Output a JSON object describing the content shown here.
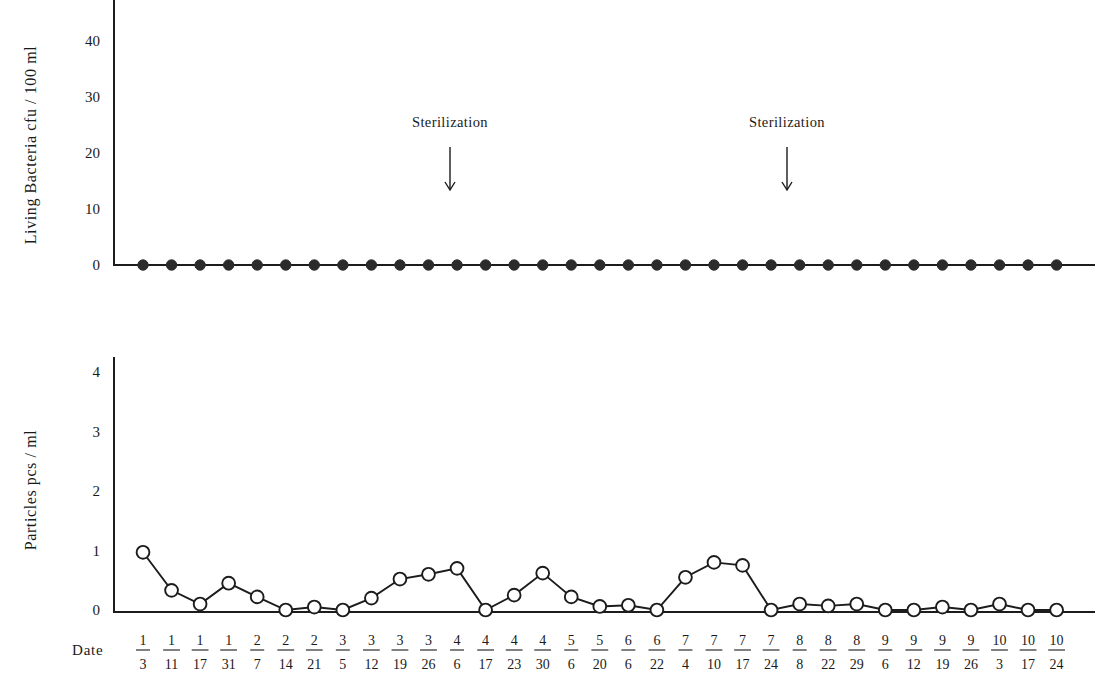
{
  "figure": {
    "width": 1110,
    "height": 681,
    "background": "#ffffff",
    "ink_color": "#1c1c1c"
  },
  "x_axis": {
    "label": "Date",
    "categories": [
      "1/3",
      "1/11",
      "1/17",
      "1/31",
      "2/7",
      "2/14",
      "2/21",
      "3/5",
      "3/12",
      "3/19",
      "3/26",
      "4/6",
      "4/17",
      "4/23",
      "4/30",
      "5/6",
      "5/20",
      "6/6",
      "6/22",
      "7/4",
      "7/10",
      "7/17",
      "7/24",
      "8/8",
      "8/22",
      "8/29",
      "9/6",
      "9/12",
      "9/19",
      "9/26",
      "10/3",
      "10/17",
      "10/24"
    ],
    "category_parts": [
      {
        "month": "1",
        "day": "3"
      },
      {
        "month": "1",
        "day": "11"
      },
      {
        "month": "1",
        "day": "17"
      },
      {
        "month": "1",
        "day": "31"
      },
      {
        "month": "2",
        "day": "7"
      },
      {
        "month": "2",
        "day": "14"
      },
      {
        "month": "2",
        "day": "21"
      },
      {
        "month": "3",
        "day": "5"
      },
      {
        "month": "3",
        "day": "12"
      },
      {
        "month": "3",
        "day": "19"
      },
      {
        "month": "3",
        "day": "26"
      },
      {
        "month": "4",
        "day": "6"
      },
      {
        "month": "4",
        "day": "17"
      },
      {
        "month": "4",
        "day": "23"
      },
      {
        "month": "4",
        "day": "30"
      },
      {
        "month": "5",
        "day": "6"
      },
      {
        "month": "5",
        "day": "20"
      },
      {
        "month": "6",
        "day": "6"
      },
      {
        "month": "6",
        "day": "22"
      },
      {
        "month": "7",
        "day": "4"
      },
      {
        "month": "7",
        "day": "10"
      },
      {
        "month": "7",
        "day": "17"
      },
      {
        "month": "7",
        "day": "24"
      },
      {
        "month": "8",
        "day": "8"
      },
      {
        "month": "8",
        "day": "22"
      },
      {
        "month": "8",
        "day": "29"
      },
      {
        "month": "9",
        "day": "6"
      },
      {
        "month": "9",
        "day": "12"
      },
      {
        "month": "9",
        "day": "19"
      },
      {
        "month": "9",
        "day": "26"
      },
      {
        "month": "10",
        "day": "3"
      },
      {
        "month": "10",
        "day": "17"
      },
      {
        "month": "10",
        "day": "24"
      }
    ]
  },
  "annotations": [
    {
      "text": "Sterilization",
      "at_category": "4/6",
      "x": 450,
      "text_y": 127,
      "arrow_top": 147,
      "arrow_bottom": 190
    },
    {
      "text": "Sterilization",
      "at_category": "7/24",
      "x": 787,
      "text_y": 127,
      "arrow_top": 147,
      "arrow_bottom": 190
    }
  ],
  "chart_data": [
    {
      "id": "bacteria",
      "type": "line",
      "title": "",
      "xlabel": "Date",
      "ylabel": "Living Bacteria cfu / 100 ml",
      "ylim": [
        0,
        45
      ],
      "yticks": [
        0,
        10,
        20,
        30,
        40
      ],
      "ytick_labels": [
        "0",
        "10",
        "20",
        "30",
        "40"
      ],
      "grid": false,
      "legend": "none",
      "marker": "filled-circle",
      "categories": [
        "1/3",
        "1/11",
        "1/17",
        "1/31",
        "2/7",
        "2/14",
        "2/21",
        "3/5",
        "3/12",
        "3/19",
        "3/26",
        "4/6",
        "4/17",
        "4/23",
        "4/30",
        "5/6",
        "5/20",
        "6/6",
        "6/22",
        "7/4",
        "7/10",
        "7/17",
        "7/24",
        "8/8",
        "8/22",
        "8/29",
        "9/6",
        "9/12",
        "9/19",
        "9/26",
        "10/3",
        "10/17",
        "10/24"
      ],
      "values": [
        0,
        0,
        0,
        0,
        0,
        0,
        0,
        0,
        0,
        0,
        0,
        0,
        0,
        0,
        0,
        0,
        0,
        0,
        0,
        0,
        0,
        0,
        0,
        0,
        0,
        0,
        0,
        0,
        0,
        0,
        0,
        0,
        0
      ]
    },
    {
      "id": "particles",
      "type": "line",
      "title": "",
      "xlabel": "Date",
      "ylabel": "Particles pcs / ml",
      "ylim": [
        0,
        4.4
      ],
      "yticks": [
        0,
        1,
        2,
        3,
        4
      ],
      "ytick_labels": [
        "0",
        "1",
        "2",
        "3",
        "4"
      ],
      "grid": false,
      "legend": "none",
      "marker": "open-circle",
      "categories": [
        "1/3",
        "1/11",
        "1/17",
        "1/31",
        "2/7",
        "2/14",
        "2/21",
        "3/5",
        "3/12",
        "3/19",
        "3/26",
        "4/6",
        "4/17",
        "4/23",
        "4/30",
        "5/6",
        "5/20",
        "6/6",
        "6/22",
        "7/4",
        "7/10",
        "7/17",
        "7/24",
        "8/8",
        "8/22",
        "8/29",
        "9/6",
        "9/12",
        "9/19",
        "9/26",
        "10/3",
        "10/17",
        "10/24"
      ],
      "values": [
        0.97,
        0.33,
        0.1,
        0.45,
        0.22,
        0.0,
        0.05,
        0.0,
        0.2,
        0.52,
        0.6,
        0.7,
        0.0,
        0.25,
        0.62,
        0.22,
        0.06,
        0.08,
        0.0,
        0.55,
        0.8,
        0.75,
        0.0,
        0.1,
        0.07,
        0.1,
        0.0,
        0.0,
        0.05,
        0.0,
        0.1,
        0.0,
        0.0
      ]
    }
  ]
}
